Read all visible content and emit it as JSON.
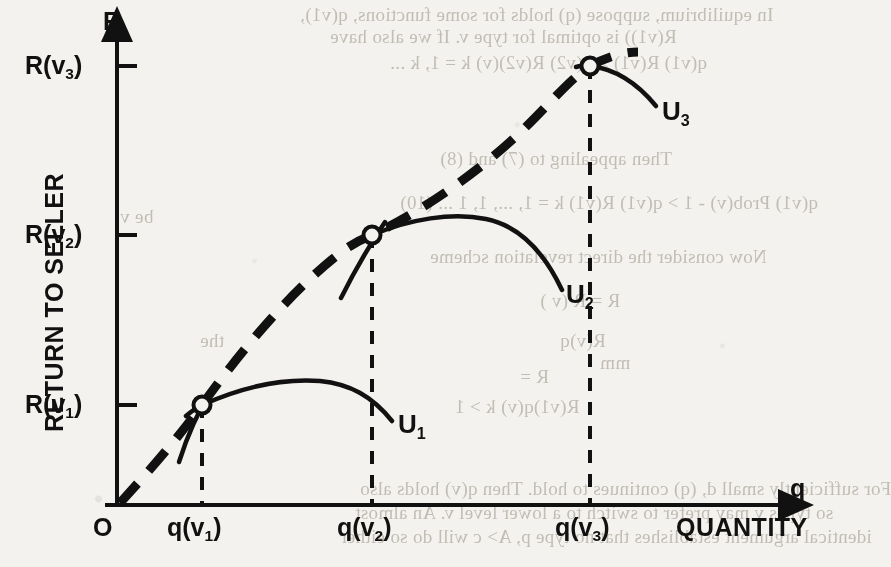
{
  "figure": {
    "background_color": "#f4f2ee",
    "ink_color": "#111111",
    "y_axis_name": "R",
    "x_axis_name": "q",
    "y_axis_title": "RETURN TO SELLER",
    "x_axis_title": "QUANTITY",
    "origin_label": "O",
    "y_ticks": [
      {
        "id": "rv3",
        "label_main": "R(v",
        "label_sub": "3",
        "label_tail": ")",
        "text": "R(v3)",
        "y_px": 66
      },
      {
        "id": "rv2",
        "label_main": "R(v",
        "label_sub": "2",
        "label_tail": ")",
        "text": "R(v2)",
        "y_px": 235
      },
      {
        "id": "rv1",
        "label_main": "R(v",
        "label_sub": "1",
        "label_tail": ")",
        "text": "R(v1)",
        "y_px": 405
      }
    ],
    "x_ticks": [
      {
        "id": "qv1",
        "label_main": "q(v",
        "label_sub": "1",
        "label_tail": ")",
        "text": "q(v1)",
        "x_px": 202
      },
      {
        "id": "qv2",
        "label_main": "q(v",
        "label_sub": "2",
        "label_tail": ")",
        "text": "q(v2)",
        "x_px": 372
      },
      {
        "id": "qv3",
        "label_main": "q(v",
        "label_sub": "3",
        "label_tail": ")",
        "text": "q(v3)",
        "x_px": 590
      }
    ],
    "curve_labels": [
      {
        "id": "u1",
        "label_main": "U",
        "label_sub": "1",
        "text": "U1",
        "x_px": 398,
        "y_px": 425
      },
      {
        "id": "u2",
        "label_main": "U",
        "label_sub": "2",
        "text": "U2",
        "x_px": 566,
        "y_px": 295
      },
      {
        "id": "u3",
        "label_main": "U",
        "label_sub": "3",
        "text": "U3",
        "x_px": 668,
        "y_px": 112
      }
    ]
  },
  "chart_data": {
    "type": "line",
    "title": "",
    "xlabel": "QUANTITY",
    "ylabel": "RETURN TO SELLER",
    "x_axis_symbol": "q",
    "y_axis_symbol": "R",
    "xlim": [
      0,
      1
    ],
    "ylim": [
      0,
      1
    ],
    "grid": false,
    "legend": "inline-curve-labels",
    "annotations": [
      "O",
      "R(v1)",
      "R(v2)",
      "R(v3)",
      "q(v1)",
      "q(v2)",
      "q(v3)",
      "U1",
      "U2",
      "U3"
    ],
    "tangency_points": [
      {
        "name": "q(v1), R(v1)",
        "x": 0.142,
        "y": 0.146,
        "marker": "open-circle"
      },
      {
        "name": "q(v2), R(v2)",
        "x": 0.39,
        "y": 0.593,
        "marker": "open-circle"
      },
      {
        "name": "q(v3), R(v3)",
        "x": 0.708,
        "y": 1.0,
        "marker": "open-circle"
      }
    ],
    "series": [
      {
        "name": "envelope",
        "style": "thick-dashed",
        "description": "Envelope of optimal returns through the three tangency points",
        "x": [
          0.0,
          0.06,
          0.142,
          0.24,
          0.33,
          0.39,
          0.47,
          0.56,
          0.65,
          0.708,
          0.78
        ],
        "y": [
          0.0,
          0.063,
          0.146,
          0.3,
          0.47,
          0.593,
          0.73,
          0.86,
          0.965,
          1.0,
          1.0
        ]
      },
      {
        "name": "U1",
        "style": "solid",
        "description": "Indifference curve of type v1, tangent to the envelope at q(v1)",
        "x": [
          0.12,
          0.142,
          0.2,
          0.27,
          0.33,
          0.39,
          0.44
        ],
        "y": [
          0.13,
          0.146,
          0.196,
          0.215,
          0.205,
          0.16,
          0.12
        ]
      },
      {
        "name": "U2",
        "style": "solid",
        "description": "Indifference curve of type v2, tangent to the envelope at q(v2)",
        "x": [
          0.368,
          0.39,
          0.46,
          0.53,
          0.6,
          0.66,
          0.7
        ],
        "y": [
          0.578,
          0.593,
          0.645,
          0.665,
          0.64,
          0.57,
          0.508
        ]
      },
      {
        "name": "U3",
        "style": "solid",
        "description": "Indifference curve of type v3, tangent to the envelope at q(v3)",
        "x": [
          0.69,
          0.708,
          0.76,
          0.82,
          0.87
        ],
        "y": [
          0.998,
          1.0,
          0.975,
          0.915,
          0.852
        ]
      },
      {
        "name": "tangent-ray-1",
        "style": "solid-short",
        "description": "Short steep ray through the tangency point at q(v1)",
        "x": [
          0.118,
          0.16
        ],
        "y": [
          0.01,
          0.195
        ]
      },
      {
        "name": "tangent-ray-2",
        "style": "solid-short",
        "description": "Short steep ray through the tangency point at q(v2)",
        "x": [
          0.33,
          0.41
        ],
        "y": [
          0.4,
          0.65
        ]
      }
    ],
    "dropline_style": "dashed-vertical",
    "droplines": [
      {
        "from": "q(v1)",
        "x": 0.142,
        "y_top": 0.146
      },
      {
        "from": "q(v2)",
        "x": 0.39,
        "y_top": 0.593
      },
      {
        "from": "q(v3)",
        "x": 0.708,
        "y_top": 1.0
      }
    ]
  },
  "page_bleed": {
    "note": "faint mirrored show-through text from the reverse side of the scanned page",
    "lines": [
      {
        "text": "In equilibrium, suppose (q) holds for some functions, q(v1),",
        "x": 300,
        "y": 4
      },
      {
        "text": "R(v1)) is optimal for type v. If we also have",
        "x": 330,
        "y": 26
      },
      {
        "text": "q(v1) R(v1)  >  q(v2) R(v2)(v)      k = 1, k ...",
        "x": 390,
        "y": 52
      },
      {
        "text": "Then appealing to (7) and (8)",
        "x": 440,
        "y": 148
      },
      {
        "text": "q(v1)  Prob(v) - 1  >  q(v1) R(v1)  k = 1, ..., 1, 1 ... (10)",
        "x": 400,
        "y": 192
      },
      {
        "text": "Now consider the direct revelation scheme",
        "x": 430,
        "y": 246
      },
      {
        "text": "R = R (v )",
        "x": 540,
        "y": 290
      },
      {
        "text": "R(v)q",
        "x": 560,
        "y": 330
      },
      {
        "text": "R =",
        "x": 520,
        "y": 366
      },
      {
        "text": "R(v1)q(v)      k > 1",
        "x": 455,
        "y": 396
      },
      {
        "text": "For sufficiently small d, (q) continues to hold. Then q(v) holds also",
        "x": 360,
        "y": 478
      },
      {
        "text": "so types v may prefer to switch to a lower level v. An almost",
        "x": 355,
        "y": 502
      },
      {
        "text": "identical argument establishes that no type p, A> c will do so either",
        "x": 340,
        "y": 526
      },
      {
        "text": "be  v",
        "x": 120,
        "y": 206
      },
      {
        "text": "the",
        "x": 200,
        "y": 330
      },
      {
        "text": "mm",
        "x": 600,
        "y": 352
      }
    ]
  }
}
